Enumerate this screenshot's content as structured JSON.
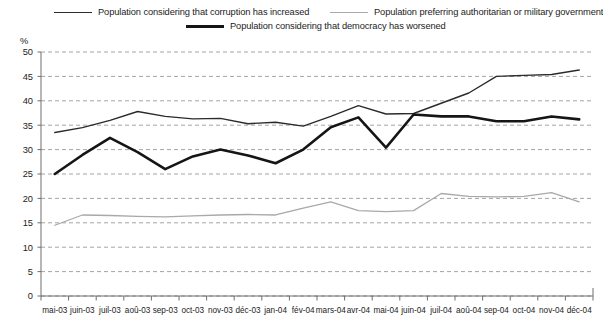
{
  "legend": {
    "items": [
      {
        "id": "corruption",
        "label": "Population considering that corruption has increased",
        "style": "thin",
        "color": "#2b2b2b"
      },
      {
        "id": "authoritarian",
        "label": "Population preferring authoritarian or military government",
        "style": "gray",
        "color": "#a9a9a9"
      },
      {
        "id": "democracy",
        "label": "Population considering that democracy has worsened",
        "style": "thick",
        "color": "#151515"
      }
    ]
  },
  "axis": {
    "y_unit": "%",
    "y_ticks": [
      "0",
      "5",
      "10",
      "15",
      "20",
      "25",
      "30",
      "35",
      "40",
      "45",
      "50"
    ]
  },
  "chart_data": {
    "type": "line",
    "title": "",
    "subtitle": "",
    "xlabel": "",
    "ylabel": "%",
    "ylim": [
      0,
      50
    ],
    "ytick_step": 5,
    "grid": true,
    "grid_style": "dashed-horizontal",
    "legend_position": "top",
    "categories": [
      "mai-03",
      "juin-03",
      "juil-03",
      "aoû-03",
      "sep-03",
      "oct-03",
      "nov-03",
      "déc-03",
      "jan-04",
      "fév-04",
      "mars-04",
      "avr-04",
      "mai-04",
      "juin-04",
      "juil-04",
      "aoû-04",
      "sep-04",
      "oct-04",
      "nov-04",
      "déc-04"
    ],
    "series": [
      {
        "name": "Population considering that corruption has increased",
        "color": "#2b2b2b",
        "width": 1.4,
        "values": [
          33.5,
          34.5,
          36.0,
          37.8,
          36.8,
          36.3,
          36.4,
          35.3,
          35.6,
          34.8,
          36.8,
          39.0,
          37.3,
          37.4,
          39.5,
          41.6,
          45.0,
          45.2,
          45.4,
          46.3
        ]
      },
      {
        "name": "Population preferring authoritarian or military government",
        "color": "#a9a9a9",
        "width": 1.3,
        "values": [
          14.5,
          16.6,
          16.5,
          16.3,
          16.2,
          16.4,
          16.6,
          16.7,
          16.6,
          18.0,
          19.3,
          17.5,
          17.3,
          17.5,
          21.0,
          20.4,
          20.3,
          20.4,
          21.2,
          19.3
        ]
      },
      {
        "name": "Population considering that democracy has worsened",
        "color": "#151515",
        "width": 2.6,
        "values": [
          25.0,
          28.9,
          32.4,
          29.5,
          26.0,
          28.6,
          30.0,
          28.8,
          27.2,
          30.0,
          34.6,
          36.6,
          30.4,
          37.2,
          36.8,
          36.8,
          35.8,
          35.8,
          36.8,
          36.2
        ]
      }
    ]
  }
}
